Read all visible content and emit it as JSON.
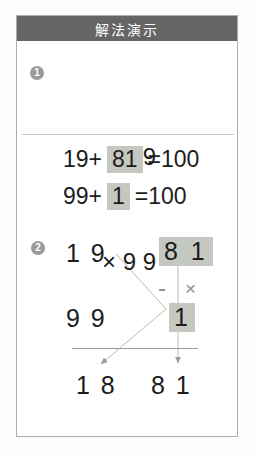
{
  "header": {
    "title": "解法演示"
  },
  "step1": {
    "badge": "1",
    "multiplicand": "1 9",
    "multiplier_row": "× 9 9"
  },
  "equations": [
    {
      "prefix": "19+",
      "highlight": "81",
      "suffix": "=100"
    },
    {
      "prefix": "99+",
      "highlight": "1",
      "suffix": "=100"
    }
  ],
  "step2": {
    "badge": "2",
    "factor_top_left": "1 9",
    "complement_top_right": "8 1",
    "minus_sign": "-",
    "times_sign": "×",
    "factor_bottom_left": "9 9",
    "complement_bottom_right": "1",
    "result_left": "1 8",
    "result_right": "8 1"
  },
  "colors": {
    "header_bg": "#656565",
    "header_text": "#ffffff",
    "badge_bg": "#9a9a9a",
    "highlight_bg": "#c5c8c1",
    "connector_line": "#b9b9b9",
    "operator_gray": "#8f8f8f",
    "card_border": "#adadad"
  }
}
